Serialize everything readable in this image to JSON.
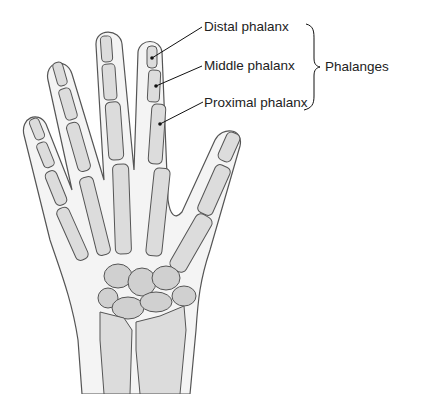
{
  "diagram": {
    "labels": [
      {
        "id": "distal",
        "text": "Distal phalanx"
      },
      {
        "id": "middle",
        "text": "Middle phalanx"
      },
      {
        "id": "proximal",
        "text": "Proximal phalanx"
      }
    ],
    "group_label": "Phalanges",
    "colors": {
      "skin": "#f4f4f4",
      "bone": "#dcdcdc",
      "outline": "#555555",
      "text": "#222222"
    }
  }
}
